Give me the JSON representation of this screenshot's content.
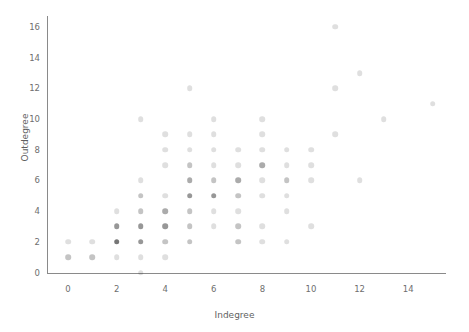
{
  "chart_data": {
    "type": "scatter",
    "title": "",
    "xlabel": "Indegree",
    "ylabel": "Outdegree",
    "xlim": [
      -1.2,
      15.8
    ],
    "ylim": [
      -1.0,
      17.2
    ],
    "xticks": [
      0,
      2,
      4,
      6,
      8,
      10,
      12,
      14
    ],
    "yticks": [
      0,
      2,
      4,
      6,
      8,
      10,
      12,
      14,
      16
    ],
    "grid": false,
    "legend": null,
    "marker": {
      "shape": "circle",
      "color": "#1a1a1a",
      "size_px": 5.6,
      "alpha": 0.14,
      "note": "Overlapping semi-transparent markers; darker dots indicate more coincident observations"
    },
    "encoding": "Each point is (indegree, outdegree) for one node; opacity accumulates where points coincide",
    "points": [
      {
        "x": 0,
        "y": 1,
        "n": 2
      },
      {
        "x": 0,
        "y": 2,
        "n": 1
      },
      {
        "x": 1,
        "y": 1,
        "n": 2
      },
      {
        "x": 1,
        "y": 2,
        "n": 1
      },
      {
        "x": 2,
        "y": 1,
        "n": 1
      },
      {
        "x": 2,
        "y": 2,
        "n": 6
      },
      {
        "x": 2,
        "y": 3,
        "n": 4
      },
      {
        "x": 2,
        "y": 4,
        "n": 1
      },
      {
        "x": 3,
        "y": 0,
        "n": 1
      },
      {
        "x": 3,
        "y": 1,
        "n": 1
      },
      {
        "x": 3,
        "y": 2,
        "n": 4
      },
      {
        "x": 3,
        "y": 3,
        "n": 4
      },
      {
        "x": 3,
        "y": 4,
        "n": 2
      },
      {
        "x": 3,
        "y": 5,
        "n": 2
      },
      {
        "x": 3,
        "y": 6,
        "n": 1
      },
      {
        "x": 3,
        "y": 10,
        "n": 1
      },
      {
        "x": 4,
        "y": 1,
        "n": 1
      },
      {
        "x": 4,
        "y": 2,
        "n": 2
      },
      {
        "x": 4,
        "y": 3,
        "n": 4
      },
      {
        "x": 4,
        "y": 4,
        "n": 3
      },
      {
        "x": 4,
        "y": 5,
        "n": 1
      },
      {
        "x": 4,
        "y": 7,
        "n": 1
      },
      {
        "x": 4,
        "y": 8,
        "n": 1
      },
      {
        "x": 4,
        "y": 9,
        "n": 1
      },
      {
        "x": 5,
        "y": 2,
        "n": 2
      },
      {
        "x": 5,
        "y": 3,
        "n": 2
      },
      {
        "x": 5,
        "y": 4,
        "n": 2
      },
      {
        "x": 5,
        "y": 5,
        "n": 4
      },
      {
        "x": 5,
        "y": 6,
        "n": 3
      },
      {
        "x": 5,
        "y": 7,
        "n": 2
      },
      {
        "x": 5,
        "y": 8,
        "n": 1
      },
      {
        "x": 5,
        "y": 9,
        "n": 1
      },
      {
        "x": 5,
        "y": 12,
        "n": 1
      },
      {
        "x": 6,
        "y": 3,
        "n": 1
      },
      {
        "x": 6,
        "y": 4,
        "n": 1
      },
      {
        "x": 6,
        "y": 5,
        "n": 4
      },
      {
        "x": 6,
        "y": 6,
        "n": 2
      },
      {
        "x": 6,
        "y": 7,
        "n": 1
      },
      {
        "x": 6,
        "y": 8,
        "n": 1
      },
      {
        "x": 6,
        "y": 9,
        "n": 1
      },
      {
        "x": 6,
        "y": 10,
        "n": 1
      },
      {
        "x": 7,
        "y": 2,
        "n": 2
      },
      {
        "x": 7,
        "y": 3,
        "n": 2
      },
      {
        "x": 7,
        "y": 4,
        "n": 1
      },
      {
        "x": 7,
        "y": 5,
        "n": 2
      },
      {
        "x": 7,
        "y": 6,
        "n": 3
      },
      {
        "x": 7,
        "y": 7,
        "n": 1
      },
      {
        "x": 7,
        "y": 8,
        "n": 1
      },
      {
        "x": 8,
        "y": 2,
        "n": 1
      },
      {
        "x": 8,
        "y": 3,
        "n": 1
      },
      {
        "x": 8,
        "y": 5,
        "n": 1
      },
      {
        "x": 8,
        "y": 6,
        "n": 1
      },
      {
        "x": 8,
        "y": 7,
        "n": 3
      },
      {
        "x": 8,
        "y": 8,
        "n": 1
      },
      {
        "x": 8,
        "y": 9,
        "n": 1
      },
      {
        "x": 8,
        "y": 10,
        "n": 1
      },
      {
        "x": 9,
        "y": 2,
        "n": 1
      },
      {
        "x": 9,
        "y": 4,
        "n": 1
      },
      {
        "x": 9,
        "y": 5,
        "n": 1
      },
      {
        "x": 9,
        "y": 6,
        "n": 2
      },
      {
        "x": 9,
        "y": 7,
        "n": 1
      },
      {
        "x": 9,
        "y": 8,
        "n": 1
      },
      {
        "x": 10,
        "y": 3,
        "n": 1
      },
      {
        "x": 10,
        "y": 6,
        "n": 1
      },
      {
        "x": 10,
        "y": 7,
        "n": 1
      },
      {
        "x": 10,
        "y": 8,
        "n": 1
      },
      {
        "x": 11,
        "y": 9,
        "n": 1
      },
      {
        "x": 11,
        "y": 12,
        "n": 1
      },
      {
        "x": 11,
        "y": 16,
        "n": 1
      },
      {
        "x": 12,
        "y": 6,
        "n": 1
      },
      {
        "x": 12,
        "y": 13,
        "n": 1
      },
      {
        "x": 13,
        "y": 10,
        "n": 1
      },
      {
        "x": 15,
        "y": 11,
        "n": 1
      }
    ]
  },
  "axes": {
    "x_tick_labels": [
      "0",
      "2",
      "4",
      "6",
      "8",
      "10",
      "12",
      "14"
    ],
    "y_tick_labels": [
      "0",
      "2",
      "4",
      "6",
      "8",
      "10",
      "12",
      "14",
      "16"
    ],
    "x_title": "Indegree",
    "y_title": "Outdegree"
  },
  "colors": {
    "background": "#ffffff",
    "axis": "#8a8a8a",
    "tick_text": "#6e6e6e",
    "label_text": "#5f5f5f",
    "marker": "#1a1a1a"
  }
}
